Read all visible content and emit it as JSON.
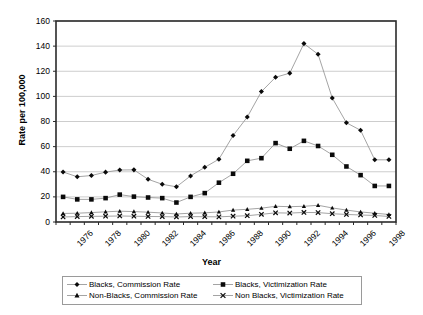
{
  "chart_data": {
    "type": "line",
    "title": "",
    "xlabel": "Year",
    "ylabel": "Rate per 100,000",
    "xlim": [
      1976,
      1999
    ],
    "ylim": [
      0,
      160
    ],
    "ytick_step": 20,
    "yticks": [
      0,
      20,
      40,
      60,
      80,
      100,
      120,
      140,
      160
    ],
    "x": [
      1976,
      1977,
      1978,
      1979,
      1980,
      1981,
      1982,
      1983,
      1984,
      1985,
      1986,
      1987,
      1988,
      1989,
      1990,
      1991,
      1992,
      1993,
      1994,
      1995,
      1996,
      1997,
      1998,
      1999
    ],
    "xtick_labels": [
      "1976",
      "",
      "1978",
      "",
      "1980",
      "",
      "1982",
      "",
      "1984",
      "",
      "1986",
      "",
      "1988",
      "",
      "1990",
      "",
      "1992",
      "",
      "1994",
      "",
      "1996",
      "",
      "1998",
      ""
    ],
    "grid": "horizontal",
    "legend_position": "bottom",
    "series": [
      {
        "name": "Blacks, Commission Rate",
        "marker": "diamond",
        "color": "#000000",
        "values": [
          39.8,
          36.0,
          37.0,
          39.7,
          41.4,
          41.5,
          34.0,
          30.0,
          28.0,
          36.7,
          43.5,
          50.0,
          68.8,
          83.5,
          103.8,
          115.2,
          118.5,
          142.0,
          133.5,
          98.7,
          79.0,
          73.0,
          49.5,
          49.5
        ]
      },
      {
        "name": "Blacks, Victimization Rate",
        "marker": "square",
        "color": "#000000",
        "values": [
          20.0,
          18.0,
          18.0,
          19.0,
          21.8,
          20.2,
          19.5,
          19.0,
          15.5,
          20.0,
          23.0,
          31.3,
          38.4,
          48.7,
          50.8,
          62.8,
          58.3,
          64.6,
          60.5,
          53.5,
          44.2,
          37.3,
          28.7,
          28.7
        ]
      },
      {
        "name": "Non-Blacks, Commission Rate",
        "marker": "triangle",
        "color": "#000000",
        "values": [
          6.8,
          7.0,
          7.5,
          8.1,
          8.6,
          8.3,
          7.8,
          7.2,
          6.4,
          7.0,
          7.3,
          8.0,
          9.5,
          10.1,
          11.0,
          12.5,
          12.2,
          12.5,
          13.3,
          11.2,
          9.5,
          8.0,
          7.0,
          6.0
        ]
      },
      {
        "name": "Non Blacks, Victimization Rate",
        "marker": "x",
        "color": "#000000",
        "values": [
          4.0,
          4.3,
          4.5,
          4.6,
          4.8,
          4.6,
          4.4,
          4.3,
          4.0,
          4.3,
          4.2,
          4.1,
          4.6,
          5.0,
          6.1,
          7.3,
          7.1,
          7.6,
          7.5,
          6.6,
          6.0,
          5.6,
          5.2,
          4.4
        ]
      }
    ]
  },
  "legend": {
    "items": [
      {
        "label": "Blacks, Commission Rate",
        "marker": "diamond"
      },
      {
        "label": "Blacks, Victimization Rate",
        "marker": "square"
      },
      {
        "label": "Non-Blacks, Commission Rate",
        "marker": "triangle"
      },
      {
        "label": "Non Blacks, Victimization Rate",
        "marker": "x"
      }
    ]
  }
}
